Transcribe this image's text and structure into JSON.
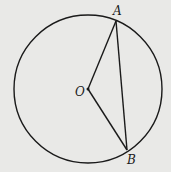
{
  "diagram": {
    "type": "circle-geometry",
    "circle": {
      "center_label": "O",
      "cx": 88,
      "cy": 89,
      "r": 74
    },
    "points": [
      {
        "label": "A",
        "x": 116,
        "y": 21,
        "label_x": 113,
        "label_y": 15
      },
      {
        "label": "B",
        "x": 127,
        "y": 150,
        "label_x": 127,
        "label_y": 164
      },
      {
        "label": "O",
        "x": 88,
        "y": 89,
        "label_x": 75,
        "label_y": 96
      }
    ],
    "segments": [
      {
        "from": "O",
        "to": "A"
      },
      {
        "from": "O",
        "to": "B"
      },
      {
        "from": "A",
        "to": "B"
      }
    ],
    "colors": {
      "stroke": "#1a1a1a",
      "background": "#e9e9e7"
    }
  }
}
